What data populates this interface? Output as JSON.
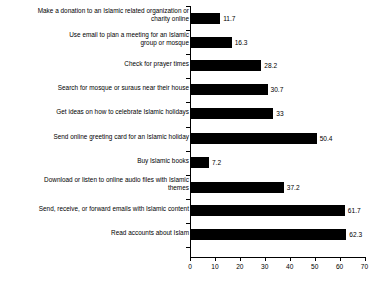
{
  "chart_data": {
    "type": "bar",
    "orientation": "horizontal",
    "title": "",
    "subtitle": "",
    "xlabel": "",
    "ylabel": "",
    "xlim": [
      0,
      70
    ],
    "xticks": [
      0,
      10,
      20,
      30,
      40,
      50,
      60,
      70
    ],
    "xtick_labels": [
      "0",
      "10",
      "20",
      "30",
      "40",
      "50",
      "60",
      "70"
    ],
    "grid": false,
    "legend": null,
    "bar_color": "#000000",
    "categories": [
      "Make a donation to an Islamic related organization or charity online",
      "Use email to plan a meeting for an Islamic group or mosque",
      "Check for prayer times",
      "Search for mosque or suraus near their house",
      "Get ideas on how to celebrate Islamic holidays",
      "Send online greeting card for an Islamic holiday",
      "Buy Islamic books",
      "Download or listen to online audio files with Islamic themes",
      "Send, receive, or forward emails with Islamic content",
      "Read accounts about Islam"
    ],
    "values": [
      11.7,
      16.3,
      28.2,
      30.7,
      33,
      50.4,
      7.2,
      37.2,
      61.7,
      62.3
    ],
    "value_labels": [
      "11.7",
      "16.3",
      "28.2",
      "30.7",
      "33",
      "50.4",
      "7.2",
      "37.2",
      "61.7",
      "62.3"
    ],
    "category_lines": [
      [
        "Make a donation to an Islamic related organization or",
        "charity online"
      ],
      [
        "Use email to plan a meeting for an Islamic",
        "group or mosque"
      ],
      [
        "Check for prayer times"
      ],
      [
        "Search for mosque or suraus near their house"
      ],
      [
        "Get ideas on how to celebrate Islamic holidays"
      ],
      [
        "Send online greeting card for an Islamic holiday"
      ],
      [
        "Buy Islamic books"
      ],
      [
        "Download or listen to online audio files with Islamic",
        "themes"
      ],
      [
        "Send, receive, or forward emails with Islamic content"
      ],
      [
        "Read accounts about Islam"
      ]
    ]
  }
}
